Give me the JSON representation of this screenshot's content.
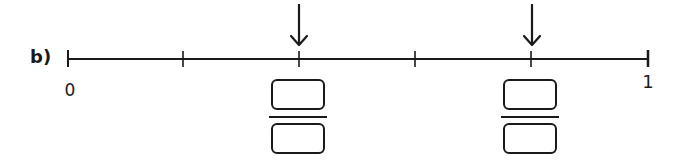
{
  "exercise": {
    "label": "b)"
  },
  "number_line": {
    "start_label": "0",
    "end_label": "1",
    "divisions": 5,
    "tick_x": [
      68,
      183,
      299,
      415,
      531,
      648
    ],
    "axis_y": 59,
    "line_color": "#1a1a1a"
  },
  "markers": [
    {
      "position": "2/5",
      "tick_index": 2,
      "x": 299,
      "numerator": "",
      "denominator": ""
    },
    {
      "position": "4/5",
      "tick_index": 4,
      "x": 531,
      "numerator": "",
      "denominator": ""
    }
  ]
}
